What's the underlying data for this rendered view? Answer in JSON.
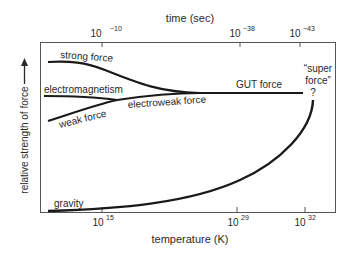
{
  "diagram": {
    "top_axis": {
      "title": "time (sec)",
      "ticks": [
        {
          "base": "10",
          "exp": "−10"
        },
        {
          "base": "10",
          "exp": "−38"
        },
        {
          "base": "10",
          "exp": "−43"
        }
      ]
    },
    "bottom_axis": {
      "title": "temperature (K)",
      "ticks": [
        {
          "base": "10",
          "exp": "15"
        },
        {
          "base": "10",
          "exp": "29"
        },
        {
          "base": "10",
          "exp": "32"
        }
      ]
    },
    "y_axis": {
      "title": "relative strength of force",
      "arrow": "up-arrow-icon"
    },
    "curves": {
      "strong": "strong force",
      "electromagnetism": "electromagnetism",
      "weak": "weak force",
      "electroweak": "electroweak force",
      "gut": "GUT force",
      "gravity": "gravity",
      "super_line1": "“super",
      "super_line2": "force”",
      "super_q": "?"
    },
    "colors": {
      "line": "#1a1a1a",
      "frame": "#555555",
      "text": "#2a2a2a"
    }
  }
}
